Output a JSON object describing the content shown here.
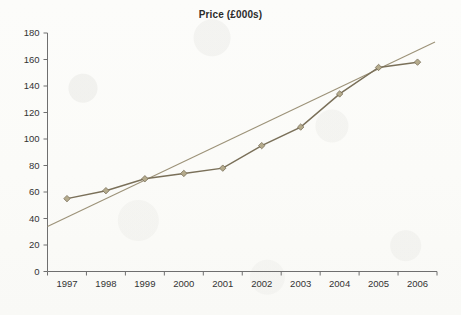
{
  "chart_data": {
    "type": "line",
    "title": "Price (£000s)",
    "xlabel": "",
    "ylabel": "",
    "grid": false,
    "legend": "none",
    "xlim": [
      1997,
      2006
    ],
    "ylim": [
      0,
      180
    ],
    "ytick_step": 20,
    "categories": [
      "1997",
      "1998",
      "1999",
      "2000",
      "2001",
      "2002",
      "2003",
      "2004",
      "2005",
      "2006"
    ],
    "yticks": [
      "0",
      "20",
      "40",
      "60",
      "80",
      "100",
      "120",
      "140",
      "160",
      "180"
    ],
    "series": [
      {
        "name": "Price",
        "marker": "diamond",
        "color": "#7a7059",
        "marker_color": "#b5ab8c",
        "values": [
          55,
          61,
          70,
          74,
          78,
          95,
          109,
          134,
          154,
          158
        ]
      },
      {
        "name": "Linear trendline",
        "marker": "none",
        "color": "#9c9278",
        "values": [
          41,
          55,
          69,
          83,
          97,
          111,
          125,
          139,
          153,
          167
        ]
      }
    ]
  },
  "axes": {
    "axis_color": "#6f6f6f",
    "tick_label_color": "#333333"
  },
  "page": {
    "background": "#fdfdfb"
  }
}
